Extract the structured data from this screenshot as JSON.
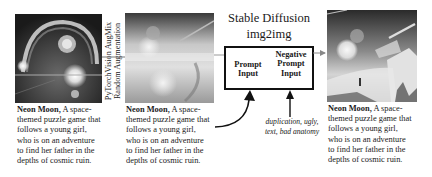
{
  "diagram": {
    "augmentation_label_line1": "PyTorchVision AugMix",
    "augmentation_label_line2": "Random Augmentation",
    "model_title": "Stable Diffusion",
    "model_subtitle": "img2img",
    "prompt_input_line1": "Prompt",
    "prompt_input_line2": "Input",
    "negative_prompt_line1": "Negative",
    "negative_prompt_line2": "Prompt",
    "negative_prompt_line3": "Input",
    "negative_prompt_text_line1": "duplication, ugly,",
    "negative_prompt_text_line2": "text, bad anatomy"
  },
  "panels": [
    {
      "image": "original-neon-moon-image",
      "caption_bold": "Neon Moon,",
      "caption_lines": [
        " A space-",
        "themed puzzle game that",
        "follows a young girl,",
        "who is on an  adventure",
        "to find her father in the",
        "depths of cosmic ruin."
      ]
    },
    {
      "image": "augmented-neon-moon-image",
      "caption_bold": "Neon Moon,",
      "caption_lines": [
        " A space-",
        "themed puzzle game that",
        "follows a young girl,",
        "who is on an  adventure",
        "to find her father in the",
        "depths of cosmic ruin."
      ]
    },
    {
      "image": "generated-neon-moon-image",
      "caption_bold": "Neon Moon,",
      "caption_lines": [
        " A space-",
        "themed puzzle game that",
        "follows a young girl,",
        "who is on an  adventure",
        "to find her father in the",
        "depths of cosmic ruin."
      ]
    }
  ]
}
